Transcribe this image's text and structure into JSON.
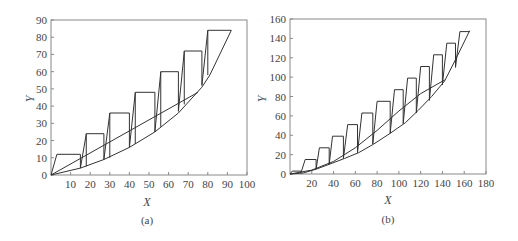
{
  "chart_data": [
    {
      "type": "line",
      "caption": "(a)",
      "title": "",
      "xlabel": "X",
      "ylabel": "Y",
      "xlim": [
        0,
        100
      ],
      "ylim": [
        0,
        90
      ],
      "xticks": [
        10,
        20,
        30,
        40,
        50,
        60,
        70,
        80,
        90,
        100
      ],
      "yticks": [
        0,
        10,
        20,
        30,
        40,
        50,
        60,
        70,
        80,
        90
      ],
      "grid": false,
      "series": [
        {
          "name": "equilibrium-curve",
          "x": [
            0,
            15,
            27,
            40,
            53,
            65,
            77,
            81,
            92
          ],
          "y": [
            0,
            4,
            9,
            16,
            25,
            36,
            51,
            58,
            84
          ]
        },
        {
          "name": "operating-line",
          "x": [
            0,
            75
          ],
          "y": [
            0,
            48
          ]
        },
        {
          "name": "stage-steps",
          "x": [
            0,
            3,
            15,
            15,
            18,
            27,
            27,
            30,
            40,
            40,
            43,
            53,
            53,
            56,
            65,
            65,
            68,
            77,
            77,
            80,
            92
          ],
          "y": [
            0,
            12,
            12,
            4,
            24,
            24,
            9,
            36,
            36,
            16,
            48,
            48,
            25,
            60,
            60,
            37,
            72,
            72,
            52,
            84,
            84
          ]
        },
        {
          "name": "stage-verticals",
          "x": [
            18,
            30,
            43,
            56,
            68,
            80
          ],
          "y_from": [
            5,
            10,
            18,
            28,
            41,
            58
          ],
          "y_to": [
            24,
            36,
            48,
            60,
            72,
            84
          ]
        }
      ]
    },
    {
      "type": "line",
      "caption": "(b)",
      "title": "",
      "xlabel": "X",
      "ylabel": "Y",
      "xlim": [
        0,
        180
      ],
      "ylim": [
        0,
        160
      ],
      "xticks": [
        20,
        40,
        60,
        80,
        100,
        120,
        140,
        160,
        180
      ],
      "yticks": [
        0,
        20,
        40,
        60,
        80,
        100,
        120,
        140,
        160
      ],
      "grid": false,
      "series": [
        {
          "name": "equilibrium-curve",
          "x": [
            0,
            12,
            24,
            36,
            50,
            63,
            77,
            92,
            106,
            118,
            130,
            142,
            152,
            165
          ],
          "y": [
            0,
            1,
            5,
            10,
            16,
            22,
            31,
            42,
            53,
            66,
            80,
            96,
            118,
            148
          ]
        },
        {
          "name": "operating-line",
          "x": [
            0,
            20,
            40,
            60,
            80,
            100,
            120,
            142
          ],
          "y": [
            0,
            4,
            13,
            27,
            45,
            65,
            83,
            97
          ]
        },
        {
          "name": "stage-steps",
          "x": [
            0,
            2,
            10,
            10,
            14,
            24,
            24,
            27,
            36,
            36,
            39,
            49,
            49,
            53,
            62,
            62,
            66,
            76,
            76,
            80,
            92,
            92,
            96,
            104,
            104,
            108,
            116,
            116,
            120,
            128,
            128,
            132,
            140,
            140,
            144,
            152,
            152,
            156,
            165
          ],
          "y": [
            0,
            3,
            3,
            1,
            15,
            15,
            5,
            27,
            27,
            10,
            39,
            39,
            16,
            51,
            51,
            22,
            63,
            63,
            31,
            75,
            75,
            42,
            87,
            87,
            52,
            99,
            99,
            63,
            111,
            111,
            76,
            123,
            123,
            92,
            135,
            135,
            110,
            147,
            147
          ]
        }
      ]
    }
  ]
}
